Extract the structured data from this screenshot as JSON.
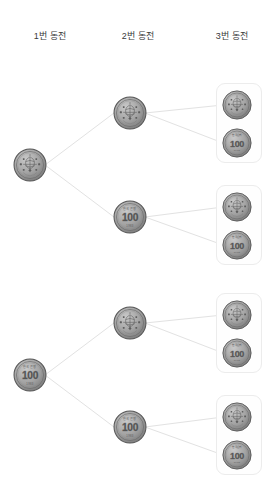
{
  "diagram": {
    "title_visible": false,
    "type": "probability-tree",
    "background_color": "#ffffff",
    "line_color": "#e2e2e2",
    "box_border_color": "#ececec",
    "coin_color": "#8c8c8c",
    "coin_dark": "#4f4f4f",
    "headers": [
      {
        "id": "coin1",
        "label": "1번 동전"
      },
      {
        "id": "coin2",
        "label": "2번 동전"
      },
      {
        "id": "coin3",
        "label": "3번 동전"
      }
    ],
    "coin_faces": {
      "heads": {
        "name": "heads-coin",
        "label": "",
        "denomination": ""
      },
      "tails": {
        "name": "tails-coin",
        "label": "100",
        "top_text": "한국은행",
        "bottom_text": "1983"
      }
    },
    "columns": [
      {
        "id": "col1",
        "header": "1번 동전",
        "nodes": [
          {
            "id": "n1-h",
            "face": "heads",
            "x": 13,
            "y": 148
          },
          {
            "id": "n1-t",
            "face": "tails",
            "x": 13,
            "y": 358
          }
        ]
      },
      {
        "id": "col2",
        "header": "2번 동전",
        "nodes": [
          {
            "id": "n2-hh",
            "face": "heads",
            "x": 113,
            "y": 96
          },
          {
            "id": "n2-ht",
            "face": "tails",
            "x": 113,
            "y": 200
          },
          {
            "id": "n2-th",
            "face": "heads",
            "x": 113,
            "y": 306
          },
          {
            "id": "n2-tt",
            "face": "tails",
            "x": 113,
            "y": 410
          }
        ]
      },
      {
        "id": "col3",
        "header": "3번 동전",
        "boxes": [
          {
            "id": "box1",
            "x": 216,
            "y": 83,
            "w": 46,
            "h": 80
          },
          {
            "id": "box2",
            "x": 216,
            "y": 185,
            "w": 46,
            "h": 80
          },
          {
            "id": "box3",
            "x": 216,
            "y": 293,
            "w": 46,
            "h": 80
          },
          {
            "id": "box4",
            "x": 216,
            "y": 395,
            "w": 46,
            "h": 80
          }
        ],
        "nodes": [
          {
            "id": "n3-hhh",
            "face": "heads",
            "x": 222,
            "y": 90
          },
          {
            "id": "n3-hht",
            "face": "tails",
            "x": 222,
            "y": 128
          },
          {
            "id": "n3-hth",
            "face": "heads",
            "x": 222,
            "y": 192
          },
          {
            "id": "n3-htt",
            "face": "tails",
            "x": 222,
            "y": 230
          },
          {
            "id": "n3-thh",
            "face": "heads",
            "x": 222,
            "y": 300
          },
          {
            "id": "n3-tht",
            "face": "tails",
            "x": 222,
            "y": 338
          },
          {
            "id": "n3-tth",
            "face": "heads",
            "x": 222,
            "y": 402
          },
          {
            "id": "n3-ttt",
            "face": "tails",
            "x": 222,
            "y": 440
          }
        ]
      }
    ],
    "edges": [
      {
        "from": "n1-h",
        "to": "n2-hh"
      },
      {
        "from": "n1-h",
        "to": "n2-ht"
      },
      {
        "from": "n1-t",
        "to": "n2-th"
      },
      {
        "from": "n1-t",
        "to": "n2-tt"
      },
      {
        "from": "n2-hh",
        "to": "n3-hhh"
      },
      {
        "from": "n2-hh",
        "to": "n3-hht"
      },
      {
        "from": "n2-ht",
        "to": "n3-hth"
      },
      {
        "from": "n2-ht",
        "to": "n3-htt"
      },
      {
        "from": "n2-th",
        "to": "n3-thh"
      },
      {
        "from": "n2-th",
        "to": "n3-tht"
      },
      {
        "from": "n2-tt",
        "to": "n3-tth"
      },
      {
        "from": "n2-tt",
        "to": "n3-ttt"
      }
    ]
  }
}
